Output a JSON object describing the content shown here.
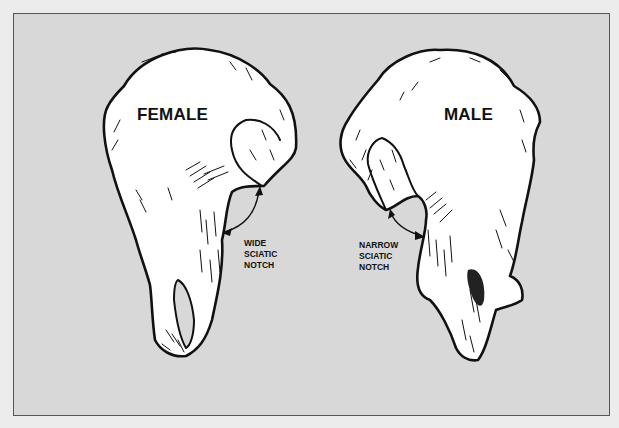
{
  "figure": {
    "panels": [
      {
        "title": "FEMALE",
        "annotation": [
          "WIDE",
          "SCIATIC",
          "NOTCH"
        ]
      },
      {
        "title": "MALE",
        "annotation": [
          "NARROW",
          "SCIATIC",
          "NOTCH"
        ]
      }
    ],
    "colors": {
      "page_background": "#ececec",
      "panel_background": "#d8d8d8",
      "bone_fill": "#ffffff",
      "ink": "#111111"
    }
  }
}
